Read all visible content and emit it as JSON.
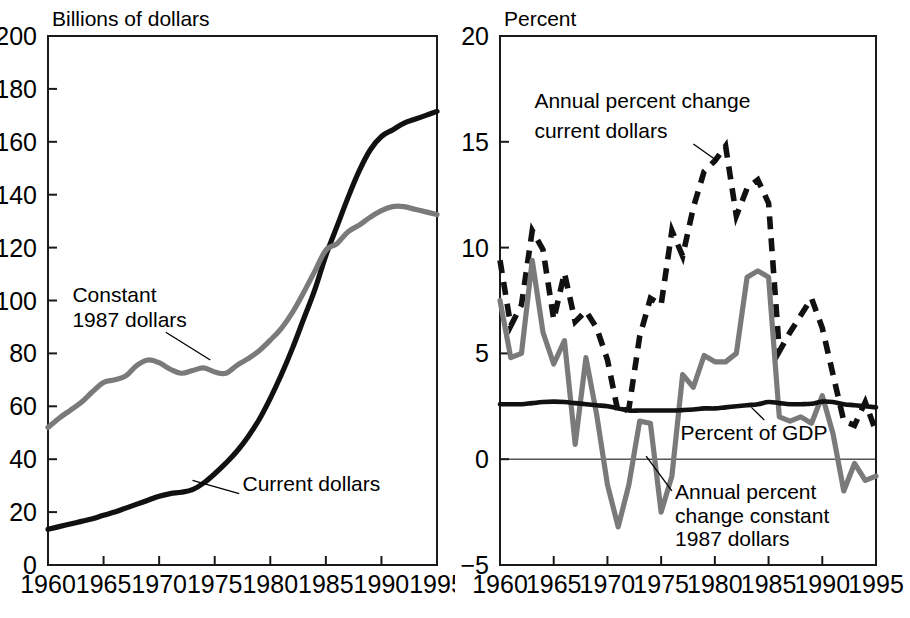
{
  "figure": {
    "width": 910,
    "height": 618,
    "background": "#ffffff",
    "colors": {
      "black": "#111111",
      "gray": "#7a7a7a",
      "axis": "#1a1a1a",
      "zero_line": "#555555"
    }
  },
  "chart_data": [
    {
      "id": "left",
      "type": "line",
      "title": "Billions of dollars",
      "xlabel": "",
      "ylabel": "Billions of dollars",
      "xlim": [
        1960,
        1995
      ],
      "ylim": [
        0,
        200
      ],
      "ytick_values": [
        0,
        20,
        40,
        60,
        80,
        100,
        120,
        140,
        160,
        180,
        200
      ],
      "ytick_labels": [
        "0",
        "20",
        "40",
        "60",
        "80",
        "100",
        "120",
        "140",
        "160",
        "180",
        "200"
      ],
      "xtick_values": [
        1960,
        1965,
        1970,
        1975,
        1980,
        1985,
        1990,
        1995
      ],
      "xtick_labels": [
        "1960",
        "1965",
        "1970",
        "1975",
        "1980",
        "1985",
        "1990",
        "1995"
      ],
      "grid": false,
      "legend": "inline-annotations",
      "x": [
        1960,
        1961,
        1962,
        1963,
        1964,
        1965,
        1966,
        1967,
        1968,
        1969,
        1970,
        1971,
        1972,
        1973,
        1974,
        1975,
        1976,
        1977,
        1978,
        1979,
        1980,
        1981,
        1982,
        1983,
        1984,
        1985,
        1986,
        1987,
        1988,
        1989,
        1990,
        1991,
        1992,
        1993,
        1994,
        1995
      ],
      "series": [
        {
          "name": "Current dollars",
          "style": "solid",
          "color": "#111111",
          "label": "Current dollars",
          "values": [
            13.5,
            14.5,
            15.5,
            16.5,
            17.5,
            18.8,
            20.0,
            21.5,
            23.0,
            24.5,
            26.0,
            27.0,
            27.5,
            28.5,
            31.0,
            34.5,
            38.5,
            43.0,
            48.5,
            55.0,
            63.0,
            72.0,
            82.0,
            93.0,
            104.0,
            117.0,
            128.0,
            139.0,
            149.0,
            157.0,
            162.0,
            164.5,
            167.0,
            168.5,
            170.0,
            171.5
          ]
        },
        {
          "name": "Constant 1987 dollars",
          "style": "solid",
          "color": "#7a7a7a",
          "label": "Constant\n1987 dollars",
          "values": [
            52.0,
            55.5,
            58.5,
            61.5,
            65.5,
            69.0,
            70.0,
            71.5,
            75.5,
            77.5,
            76.5,
            74.0,
            72.5,
            73.5,
            74.5,
            73.0,
            72.5,
            75.5,
            78.0,
            81.0,
            85.0,
            89.5,
            95.5,
            103.0,
            111.0,
            119.0,
            121.5,
            126.0,
            128.5,
            131.5,
            134.0,
            135.5,
            135.5,
            134.5,
            133.5,
            132.5
          ]
        }
      ],
      "annotations": [
        {
          "text": "Constant",
          "x": 1962.2,
          "y": 99.5
        },
        {
          "text": "1987 dollars",
          "x": 1962.2,
          "y": 90.0
        },
        {
          "text": "Current dollars",
          "x": 1977.5,
          "y": 28.0
        }
      ]
    },
    {
      "id": "right",
      "type": "line",
      "title": "Percent",
      "xlabel": "",
      "ylabel": "Percent",
      "xlim": [
        1960,
        1995
      ],
      "ylim": [
        -5,
        20
      ],
      "ytick_values": [
        -5,
        0,
        5,
        10,
        15,
        20
      ],
      "ytick_labels": [
        "−5",
        "0",
        "5",
        "10",
        "15",
        "20"
      ],
      "xtick_values": [
        1960,
        1965,
        1970,
        1975,
        1980,
        1985,
        1990,
        1995
      ],
      "xtick_labels": [
        "1960",
        "1965",
        "1970",
        "1975",
        "1980",
        "1985",
        "1990",
        "1995"
      ],
      "grid": false,
      "zero_line": true,
      "legend": "inline-annotations",
      "x": [
        1960,
        1961,
        1962,
        1963,
        1964,
        1965,
        1966,
        1967,
        1968,
        1969,
        1970,
        1971,
        1972,
        1973,
        1974,
        1975,
        1976,
        1977,
        1978,
        1979,
        1980,
        1981,
        1982,
        1983,
        1984,
        1985,
        1986,
        1987,
        1988,
        1989,
        1990,
        1991,
        1992,
        1993,
        1994,
        1995
      ],
      "series": [
        {
          "name": "Annual percent change current dollars",
          "style": "dashed",
          "color": "#111111",
          "label": "Annual percent change\ncurrent dollars",
          "values": [
            9.4,
            6.3,
            7.3,
            10.8,
            9.9,
            6.6,
            8.8,
            6.5,
            7.0,
            6.2,
            4.7,
            2.2,
            2.4,
            5.8,
            7.6,
            7.3,
            10.8,
            9.6,
            11.9,
            13.6,
            14.1,
            14.8,
            11.5,
            12.8,
            13.2,
            12.1,
            5.1,
            6.0,
            6.8,
            7.6,
            6.2,
            4.0,
            1.8,
            1.6,
            2.7,
            1.3
          ]
        },
        {
          "name": "Annual percent change constant 1987 dollars",
          "style": "solid",
          "color": "#7a7a7a",
          "label": "Annual percent\nchange constant\n1987 dollars",
          "values": [
            7.5,
            4.8,
            5.0,
            9.4,
            6.0,
            4.5,
            5.6,
            0.7,
            4.8,
            2.1,
            -1.2,
            -3.2,
            -1.2,
            1.8,
            1.7,
            -2.5,
            -0.8,
            4.0,
            3.4,
            4.9,
            4.6,
            4.6,
            5.0,
            8.6,
            8.9,
            8.6,
            2.0,
            1.8,
            2.0,
            1.7,
            3.0,
            1.2,
            -1.5,
            -0.2,
            -1.0,
            -0.8
          ]
        },
        {
          "name": "Percent of GDP",
          "style": "solid",
          "color": "#111111",
          "label": "Percent of GDP",
          "values": [
            2.6,
            2.6,
            2.6,
            2.65,
            2.7,
            2.72,
            2.7,
            2.65,
            2.6,
            2.55,
            2.5,
            2.4,
            2.3,
            2.3,
            2.3,
            2.3,
            2.3,
            2.32,
            2.35,
            2.4,
            2.4,
            2.45,
            2.5,
            2.55,
            2.6,
            2.7,
            2.65,
            2.6,
            2.6,
            2.62,
            2.72,
            2.7,
            2.6,
            2.55,
            2.5,
            2.45
          ]
        }
      ],
      "annotations": [
        {
          "text": "Annual percent change",
          "x": 1963.2,
          "y": 16.6
        },
        {
          "text": "current dollars",
          "x": 1963.2,
          "y": 15.2
        },
        {
          "text": "Percent of GDP",
          "x": 1976.8,
          "y": 0.9
        },
        {
          "text": "Annual percent",
          "x": 1976.3,
          "y": -1.9
        },
        {
          "text": "change constant",
          "x": 1976.3,
          "y": -3.0
        },
        {
          "text": "1987 dollars",
          "x": 1976.3,
          "y": -4.1
        }
      ]
    }
  ]
}
